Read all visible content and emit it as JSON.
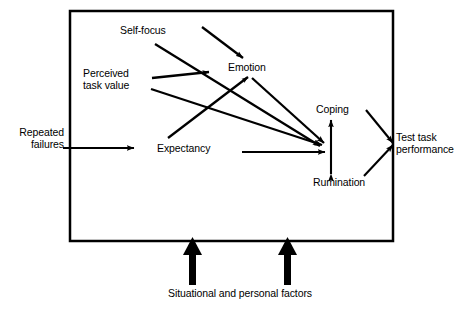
{
  "figure": {
    "background_color": "#ffffff",
    "stroke_color": "#000000",
    "box": {
      "name": "system-boundary-box",
      "x": 70,
      "y": 11,
      "width": 323,
      "height": 230,
      "border_width": 2.5
    }
  },
  "nodes": {
    "repeated_failures": {
      "label": "Repeated\nfailures",
      "id": "repeated-failures"
    },
    "self_focus": {
      "label": "Self-focus",
      "id": "self-focus"
    },
    "perceived_task_value": {
      "label": "Perceived\ntask value",
      "id": "perceived-task-value"
    },
    "expectancy": {
      "label": "Expectancy",
      "id": "expectancy"
    },
    "emotion": {
      "label": "Emotion",
      "id": "emotion"
    },
    "coping": {
      "label": "Coping",
      "id": "coping"
    },
    "rumination": {
      "label": "Rumination",
      "id": "rumination"
    },
    "test_task_performance": {
      "label": "Test task\nperformance",
      "id": "test-task-performance"
    },
    "situational_factors": {
      "label": "Situational and personal factors",
      "id": "situational-and-personal-factors"
    }
  },
  "edges": [
    {
      "id": "repeated-failures-to-box",
      "from": "repeated_failures",
      "to": "system-boundary",
      "style": "solid-arrow"
    },
    {
      "id": "self-focus-to-junction",
      "from": "self_focus",
      "to": "coping-rumination-junction",
      "style": "solid-arrow"
    },
    {
      "id": "arrow-into-emotion",
      "from": "upper-right-source",
      "to": "emotion",
      "style": "solid-arrow"
    },
    {
      "id": "perceived-task-value-to-emotion",
      "from": "perceived_task_value",
      "to": "emotion",
      "style": "solid-arrow"
    },
    {
      "id": "perceived-task-value-to-junction",
      "from": "perceived_task_value",
      "to": "coping-rumination-junction",
      "style": "solid-arrow"
    },
    {
      "id": "expectancy-to-emotion",
      "from": "expectancy",
      "to": "emotion",
      "style": "solid-arrow"
    },
    {
      "id": "expectancy-to-junction",
      "from": "expectancy",
      "to": "coping-rumination-junction",
      "style": "solid-arrow"
    },
    {
      "id": "emotion-to-junction",
      "from": "emotion",
      "to": "coping-rumination-junction",
      "style": "solid-arrow"
    },
    {
      "id": "coping-rumination-double-arrow",
      "from": "coping",
      "to": "rumination",
      "style": "double-headed-vertical-arrow"
    },
    {
      "id": "coping-to-test-task-performance",
      "from": "coping",
      "to": "test_task_performance",
      "style": "solid-arrow"
    },
    {
      "id": "rumination-to-test-task-performance",
      "from": "rumination",
      "to": "test_task_performance",
      "style": "solid-arrow"
    },
    {
      "id": "situational-factors-left-arrow",
      "from": "situational_factors",
      "to": "system-boundary",
      "style": "thick-up-arrow"
    },
    {
      "id": "situational-factors-right-arrow",
      "from": "situational_factors",
      "to": "system-boundary",
      "style": "thick-up-arrow"
    }
  ]
}
